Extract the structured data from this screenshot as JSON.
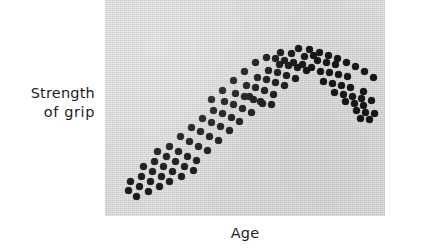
{
  "figure": {
    "width": 422,
    "height": 252,
    "background_color": "#ffffff"
  },
  "panel": {
    "background_color": "#c9c9c9",
    "left": 105,
    "top": 0,
    "width": 280,
    "height": 216
  },
  "axes": {
    "y_label_line1": "Strength",
    "y_label_line2": "of grip",
    "x_label": "Age"
  },
  "chart_data": {
    "type": "scatter",
    "title": "",
    "xlabel": "Age",
    "ylabel": "Strength of grip",
    "grid": false,
    "legend": null,
    "tick_labels": {
      "x": [],
      "y": []
    },
    "marker": {
      "shape": "circle",
      "color": "#161616",
      "size_px": 7
    },
    "point_count": 117,
    "panel_coords_note": "points are x,y in panel pixel space, 280x216, origin top-left",
    "points": [
      [
        23,
        190
      ],
      [
        31,
        196
      ],
      [
        25,
        181
      ],
      [
        34,
        186
      ],
      [
        43,
        191
      ],
      [
        36,
        176
      ],
      [
        45,
        181
      ],
      [
        54,
        186
      ],
      [
        38,
        166
      ],
      [
        47,
        171
      ],
      [
        56,
        176
      ],
      [
        64,
        181
      ],
      [
        49,
        161
      ],
      [
        58,
        166
      ],
      [
        67,
        171
      ],
      [
        76,
        176
      ],
      [
        52,
        151
      ],
      [
        61,
        156
      ],
      [
        70,
        161
      ],
      [
        79,
        166
      ],
      [
        88,
        170
      ],
      [
        64,
        146
      ],
      [
        73,
        151
      ],
      [
        82,
        156
      ],
      [
        91,
        160
      ],
      [
        75,
        136
      ],
      [
        84,
        141
      ],
      [
        93,
        146
      ],
      [
        102,
        150
      ],
      [
        86,
        127
      ],
      [
        95,
        131
      ],
      [
        104,
        136
      ],
      [
        113,
        140
      ],
      [
        97,
        118
      ],
      [
        106,
        122
      ],
      [
        115,
        126
      ],
      [
        124,
        130
      ],
      [
        108,
        110
      ],
      [
        117,
        113
      ],
      [
        126,
        117
      ],
      [
        134,
        121
      ],
      [
        119,
        101
      ],
      [
        128,
        104
      ],
      [
        137,
        108
      ],
      [
        146,
        112
      ],
      [
        130,
        93
      ],
      [
        139,
        96
      ],
      [
        148,
        99
      ],
      [
        157,
        103
      ],
      [
        141,
        85
      ],
      [
        150,
        87
      ],
      [
        159,
        90
      ],
      [
        168,
        94
      ],
      [
        152,
        77
      ],
      [
        161,
        79
      ],
      [
        170,
        82
      ],
      [
        179,
        85
      ],
      [
        144,
        96
      ],
      [
        155,
        101
      ],
      [
        166,
        104
      ],
      [
        163,
        70
      ],
      [
        172,
        72
      ],
      [
        181,
        75
      ],
      [
        190,
        78
      ],
      [
        174,
        64
      ],
      [
        183,
        65
      ],
      [
        192,
        67
      ],
      [
        201,
        70
      ],
      [
        161,
        57
      ],
      [
        170,
        58
      ],
      [
        179,
        60
      ],
      [
        188,
        62
      ],
      [
        197,
        64
      ],
      [
        206,
        67
      ],
      [
        150,
        62
      ],
      [
        139,
        71
      ],
      [
        128,
        80
      ],
      [
        117,
        90
      ],
      [
        106,
        99
      ],
      [
        212,
        60
      ],
      [
        221,
        62
      ],
      [
        230,
        64
      ],
      [
        215,
        71
      ],
      [
        224,
        72
      ],
      [
        233,
        74
      ],
      [
        242,
        76
      ],
      [
        218,
        81
      ],
      [
        227,
        83
      ],
      [
        236,
        85
      ],
      [
        245,
        87
      ],
      [
        229,
        92
      ],
      [
        238,
        94
      ],
      [
        247,
        96
      ],
      [
        256,
        98
      ],
      [
        240,
        101
      ],
      [
        249,
        103
      ],
      [
        258,
        105
      ],
      [
        251,
        110
      ],
      [
        260,
        112
      ],
      [
        269,
        113
      ],
      [
        255,
        118
      ],
      [
        264,
        119
      ],
      [
        199,
        56
      ],
      [
        208,
        55
      ],
      [
        186,
        53
      ],
      [
        175,
        52
      ],
      [
        193,
        48
      ],
      [
        204,
        49
      ],
      [
        214,
        52
      ],
      [
        223,
        55
      ],
      [
        232,
        58
      ],
      [
        241,
        62
      ],
      [
        250,
        66
      ],
      [
        259,
        71
      ],
      [
        268,
        77
      ],
      [
        266,
        100
      ],
      [
        258,
        91
      ]
    ]
  }
}
